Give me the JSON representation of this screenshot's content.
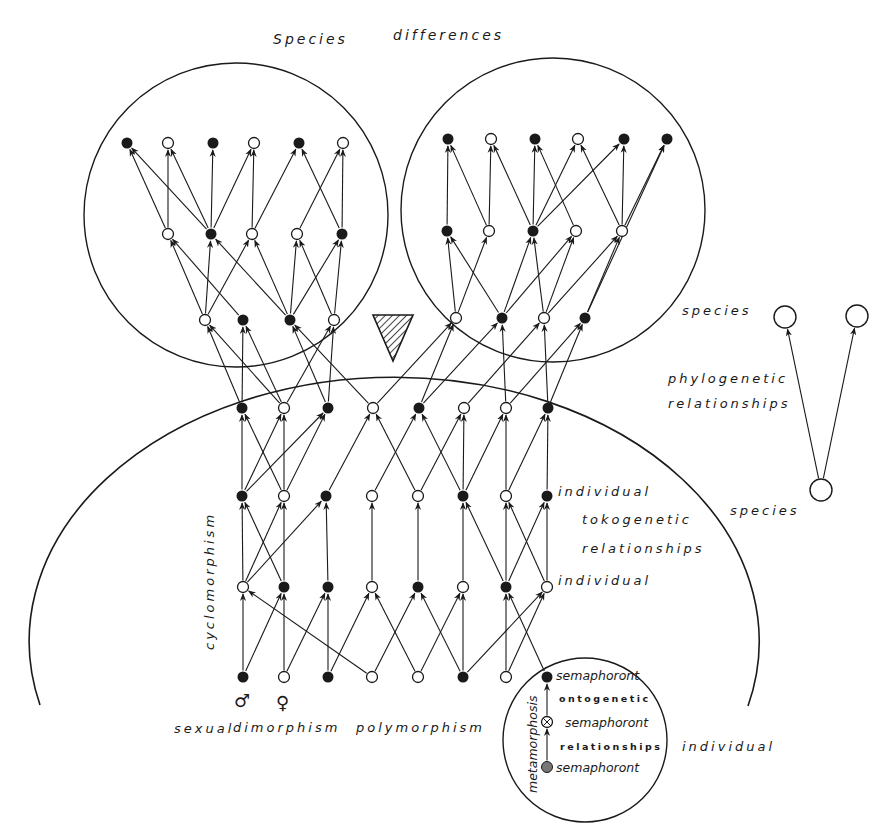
{
  "title": "Species differences",
  "labels": {
    "title_word1": "Species",
    "title_word2": "differences",
    "species_upper": "species",
    "phylogenetic": "phylogenetic",
    "phylogenetic_relationships": "relationships",
    "species_lower": "species",
    "individual_top": "individual",
    "tokogenetic": "tokogenetic",
    "tokogenetic_relationships": "relationships",
    "individual_bottom": "individual",
    "cyclomorphism": "cyclomorphism",
    "sexual": "sexual",
    "dimorphism": "dimorphism",
    "polymorphism": "polymorphism",
    "male_symbol": "♂",
    "female_symbol": "♀",
    "semaphoront_1": "semaphoront",
    "ontogenetic": "ontogenetic",
    "semaphoront_2": "semaphoront",
    "ontogenetic_relationships": "relationships",
    "semaphoront_3": "semaphoront",
    "metamorphosis": "metamorphosis",
    "individual_outer": "individual"
  },
  "colors": {
    "ink": "#1a1a1a",
    "background": "#ffffff",
    "gray_node": "#777777"
  },
  "regions": {
    "species_circle_left": {
      "cx": 236,
      "cy": 215,
      "r": 152
    },
    "species_circle_right": {
      "cx": 553,
      "cy": 210,
      "r": 152
    },
    "species_arc": {
      "cx": 397,
      "cy": 632,
      "rx": 365,
      "ry": 264
    },
    "individual_circle": {
      "cx": 585,
      "cy": 740,
      "r": 82
    }
  },
  "nodes": {
    "left_r1": [
      [
        127,
        143,
        "f"
      ],
      [
        168,
        143,
        "o"
      ],
      [
        213,
        143,
        "f"
      ],
      [
        254,
        143,
        "o"
      ],
      [
        299,
        143,
        "f"
      ],
      [
        343,
        143,
        "o"
      ]
    ],
    "left_r2": [
      [
        168,
        234,
        "o"
      ],
      [
        211,
        234,
        "f"
      ],
      [
        252,
        234,
        "o"
      ],
      [
        297,
        234,
        "o"
      ],
      [
        342,
        234,
        "f"
      ]
    ],
    "left_r3": [
      [
        205,
        320,
        "o"
      ],
      [
        243,
        320,
        "f"
      ],
      [
        290,
        320,
        "f"
      ],
      [
        334,
        320,
        "o"
      ]
    ],
    "right_r1": [
      [
        448,
        139,
        "f"
      ],
      [
        491,
        139,
        "o"
      ],
      [
        535,
        139,
        "f"
      ],
      [
        578,
        139,
        "o"
      ],
      [
        624,
        139,
        "f"
      ],
      [
        667,
        139,
        "f"
      ]
    ],
    "right_r2": [
      [
        447,
        231,
        "f"
      ],
      [
        489,
        231,
        "o"
      ],
      [
        533,
        231,
        "f"
      ],
      [
        576,
        231,
        "o"
      ],
      [
        622,
        231,
        "o"
      ]
    ],
    "right_r3": [
      [
        456,
        318,
        "o"
      ],
      [
        502,
        318,
        "f"
      ],
      [
        544,
        318,
        "o"
      ],
      [
        585,
        318,
        "f"
      ]
    ],
    "r4": [
      [
        242,
        408,
        "f"
      ],
      [
        284,
        408,
        "o"
      ],
      [
        328,
        408,
        "f"
      ],
      [
        373,
        408,
        "o"
      ],
      [
        419,
        408,
        "f"
      ],
      [
        464,
        408,
        "o"
      ],
      [
        506,
        408,
        "o"
      ],
      [
        548,
        408,
        "f"
      ]
    ],
    "r5": [
      [
        242,
        496,
        "f"
      ],
      [
        284,
        496,
        "o"
      ],
      [
        326,
        496,
        "f"
      ],
      [
        372,
        496,
        "o"
      ],
      [
        418,
        496,
        "o"
      ],
      [
        463,
        496,
        "f"
      ],
      [
        506,
        496,
        "o"
      ],
      [
        547,
        496,
        "f"
      ]
    ],
    "r6": [
      [
        243,
        587,
        "o"
      ],
      [
        284,
        587,
        "f"
      ],
      [
        328,
        587,
        "f"
      ],
      [
        372,
        587,
        "o"
      ],
      [
        418,
        587,
        "f"
      ],
      [
        463,
        587,
        "o"
      ],
      [
        506,
        587,
        "f"
      ],
      [
        547,
        587,
        "o"
      ]
    ],
    "r7": [
      [
        243,
        677,
        "f"
      ],
      [
        284,
        677,
        "o"
      ],
      [
        328,
        677,
        "f"
      ],
      [
        372,
        677,
        "o"
      ],
      [
        418,
        677,
        "o"
      ],
      [
        463,
        677,
        "f"
      ],
      [
        506,
        677,
        "o"
      ],
      [
        547,
        677,
        "f"
      ]
    ],
    "semaphoronts": [
      [
        547,
        722,
        "x"
      ],
      [
        547,
        767,
        "g"
      ]
    ],
    "phylo": [
      [
        785,
        317
      ],
      [
        857,
        316
      ],
      [
        821,
        490
      ]
    ]
  },
  "edges": [
    [
      "left_r2",
      0,
      "left_r1",
      0
    ],
    [
      "left_r2",
      0,
      "left_r1",
      1
    ],
    [
      "left_r2",
      1,
      "left_r1",
      0
    ],
    [
      "left_r2",
      1,
      "left_r1",
      1
    ],
    [
      "left_r2",
      1,
      "left_r1",
      2
    ],
    [
      "left_r2",
      1,
      "left_r1",
      3
    ],
    [
      "left_r2",
      2,
      "left_r1",
      3
    ],
    [
      "left_r2",
      2,
      "left_r1",
      4
    ],
    [
      "left_r2",
      3,
      "left_r1",
      5
    ],
    [
      "left_r2",
      4,
      "left_r1",
      4
    ],
    [
      "left_r2",
      4,
      "left_r1",
      5
    ],
    [
      "left_r3",
      0,
      "left_r2",
      0
    ],
    [
      "left_r3",
      0,
      "left_r2",
      1
    ],
    [
      "left_r3",
      0,
      "left_r2",
      2
    ],
    [
      "left_r3",
      1,
      "left_r2",
      0
    ],
    [
      "left_r3",
      2,
      "left_r2",
      1
    ],
    [
      "left_r3",
      2,
      "left_r2",
      2
    ],
    [
      "left_r3",
      2,
      "left_r2",
      3
    ],
    [
      "left_r3",
      2,
      "left_r2",
      4
    ],
    [
      "left_r3",
      3,
      "left_r2",
      3
    ],
    [
      "left_r3",
      3,
      "left_r2",
      4
    ],
    [
      "right_r2",
      0,
      "right_r1",
      0
    ],
    [
      "right_r2",
      1,
      "right_r1",
      0
    ],
    [
      "right_r2",
      1,
      "right_r1",
      1
    ],
    [
      "right_r2",
      2,
      "right_r1",
      1
    ],
    [
      "right_r2",
      2,
      "right_r1",
      2
    ],
    [
      "right_r2",
      2,
      "right_r1",
      3
    ],
    [
      "right_r2",
      2,
      "right_r1",
      4
    ],
    [
      "right_r2",
      3,
      "right_r1",
      2
    ],
    [
      "right_r2",
      4,
      "right_r1",
      3
    ],
    [
      "right_r2",
      4,
      "right_r1",
      4
    ],
    [
      "right_r2",
      4,
      "right_r1",
      5
    ],
    [
      "right_r3",
      0,
      "right_r2",
      0
    ],
    [
      "right_r3",
      0,
      "right_r2",
      1
    ],
    [
      "right_r3",
      1,
      "right_r2",
      0
    ],
    [
      "right_r3",
      1,
      "right_r2",
      2
    ],
    [
      "right_r3",
      1,
      "right_r2",
      3
    ],
    [
      "right_r3",
      2,
      "right_r2",
      2
    ],
    [
      "right_r3",
      2,
      "right_r2",
      3
    ],
    [
      "right_r3",
      2,
      "right_r2",
      4
    ],
    [
      "right_r3",
      3,
      "right_r2",
      4
    ],
    [
      "right_r3",
      3,
      "right_r1",
      5
    ],
    [
      "r4",
      0,
      "left_r3",
      0
    ],
    [
      "r4",
      0,
      "left_r3",
      1
    ],
    [
      "r4",
      1,
      "left_r3",
      0
    ],
    [
      "r4",
      1,
      "left_r3",
      1
    ],
    [
      "r4",
      1,
      "left_r3",
      3
    ],
    [
      "r4",
      2,
      "left_r3",
      2
    ],
    [
      "r4",
      2,
      "left_r3",
      3
    ],
    [
      "r4",
      3,
      "left_r3",
      2
    ],
    [
      "r4",
      3,
      "right_r3",
      0
    ],
    [
      "r4",
      4,
      "right_r3",
      0
    ],
    [
      "r4",
      4,
      "right_r3",
      1
    ],
    [
      "r4",
      5,
      "right_r3",
      2
    ],
    [
      "r4",
      6,
      "right_r3",
      1
    ],
    [
      "r4",
      6,
      "right_r3",
      3
    ],
    [
      "r4",
      7,
      "right_r3",
      2
    ],
    [
      "r4",
      7,
      "right_r3",
      3
    ],
    [
      "r5",
      0,
      "r4",
      0
    ],
    [
      "r5",
      0,
      "r4",
      1
    ],
    [
      "r5",
      0,
      "r4",
      2
    ],
    [
      "r5",
      1,
      "r4",
      0
    ],
    [
      "r5",
      1,
      "r4",
      1
    ],
    [
      "r5",
      1,
      "r4",
      2
    ],
    [
      "r5",
      2,
      "r4",
      3
    ],
    [
      "r5",
      3,
      "r4",
      4
    ],
    [
      "r5",
      4,
      "r4",
      3
    ],
    [
      "r5",
      4,
      "r4",
      5
    ],
    [
      "r5",
      5,
      "r4",
      4
    ],
    [
      "r5",
      5,
      "r4",
      5
    ],
    [
      "r5",
      5,
      "r4",
      6
    ],
    [
      "r5",
      6,
      "r4",
      6
    ],
    [
      "r5",
      6,
      "r4",
      7
    ],
    [
      "r5",
      7,
      "r4",
      7
    ],
    [
      "r6",
      0,
      "r5",
      0
    ],
    [
      "r6",
      0,
      "r5",
      1
    ],
    [
      "r6",
      0,
      "r5",
      2
    ],
    [
      "r6",
      1,
      "r5",
      0
    ],
    [
      "r6",
      1,
      "r5",
      1
    ],
    [
      "r6",
      2,
      "r5",
      2
    ],
    [
      "r6",
      3,
      "r5",
      3
    ],
    [
      "r6",
      4,
      "r5",
      4
    ],
    [
      "r6",
      5,
      "r5",
      5
    ],
    [
      "r6",
      6,
      "r5",
      5
    ],
    [
      "r6",
      6,
      "r5",
      6
    ],
    [
      "r6",
      6,
      "r5",
      7
    ],
    [
      "r6",
      7,
      "r5",
      6
    ],
    [
      "r6",
      7,
      "r5",
      7
    ],
    [
      "r7",
      0,
      "r6",
      0
    ],
    [
      "r7",
      0,
      "r6",
      1
    ],
    [
      "r7",
      1,
      "r6",
      1
    ],
    [
      "r7",
      1,
      "r6",
      2
    ],
    [
      "r7",
      2,
      "r6",
      2
    ],
    [
      "r7",
      2,
      "r6",
      3
    ],
    [
      "r7",
      3,
      "r6",
      0
    ],
    [
      "r7",
      3,
      "r6",
      4
    ],
    [
      "r7",
      4,
      "r6",
      3
    ],
    [
      "r7",
      4,
      "r6",
      5
    ],
    [
      "r7",
      5,
      "r6",
      4
    ],
    [
      "r7",
      5,
      "r6",
      5
    ],
    [
      "r7",
      5,
      "r6",
      7
    ],
    [
      "r7",
      6,
      "r6",
      6
    ],
    [
      "r7",
      6,
      "r6",
      7
    ],
    [
      "r7",
      7,
      "r6",
      6
    ],
    [
      "semaphoronts",
      0,
      "r7",
      7
    ],
    [
      "semaphoronts",
      1,
      "semaphoronts",
      0
    ],
    [
      "phylo",
      2,
      "phylo",
      0
    ],
    [
      "phylo",
      2,
      "phylo",
      1
    ]
  ]
}
